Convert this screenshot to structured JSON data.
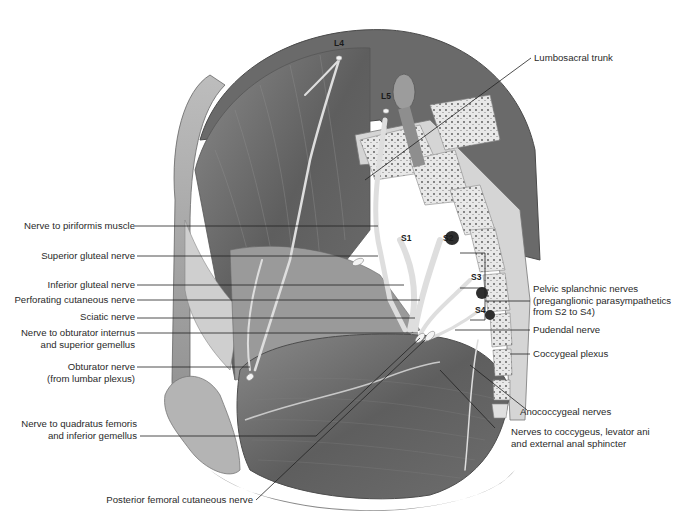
{
  "figure": {
    "colors": {
      "background": "#ffffff",
      "muscle": "#6b6b6b",
      "bone": "#e6e6e6",
      "nerve": "#d4d4d4",
      "leader": "#222222",
      "text": "#2a2a2a"
    }
  },
  "segments": {
    "l4": "L4",
    "l5": "L5",
    "s1": "S1",
    "s2": "S2",
    "s3": "S3",
    "s4": "S4"
  },
  "labels_left": {
    "piriformis": "Nerve to piriformis muscle",
    "superior_gluteal": "Superior gluteal nerve",
    "inferior_gluteal": "Inferior gluteal nerve",
    "perforating": "Perforating cutaneous nerve",
    "sciatic": "Sciatic nerve",
    "obturator_internus_1": "Nerve to obturator internus",
    "obturator_internus_2": "and superior gemellus",
    "obturator_1": "Obturator nerve",
    "obturator_2": "(from lumbar plexus)",
    "quadratus_1": "Nerve to quadratus femoris",
    "quadratus_2": "and inferior gemellus",
    "posterior_femoral": "Posterior femoral cutaneous nerve"
  },
  "labels_right": {
    "lumbosacral": "Lumbosacral trunk",
    "pelvic_splanchnic_1": "Pelvic splanchnic nerves",
    "pelvic_splanchnic_2": "(preganglionic parasympathetics",
    "pelvic_splanchnic_3": "from S2 to S4)",
    "pudendal": "Pudendal nerve",
    "coccygeal": "Coccygeal plexus",
    "anococcygeal": "Anococcygeal nerves",
    "levator_1": "Nerves to coccygeus, levator ani",
    "levator_2": "and external anal sphincter"
  }
}
